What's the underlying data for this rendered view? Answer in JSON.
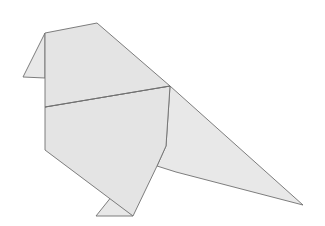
{
  "image": {
    "subject": "origami bird",
    "background_color": "#ffffff",
    "paper_color": "#e4e4e4",
    "edge_color": "#6f6f6f"
  }
}
